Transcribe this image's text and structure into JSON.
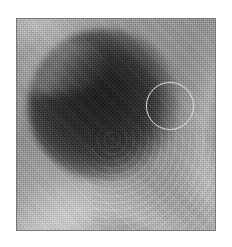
{
  "page": {
    "width": 232,
    "height": 247,
    "background_color": "#ffffff",
    "kind": "grayscale-halftone-photograph"
  },
  "plate": {
    "x": 16,
    "y": 18,
    "width": 200,
    "height": 213,
    "border_color": "#787878",
    "caption": "",
    "description": "Grayscale halftone image of a rounded cavity: a large dark central mass surrounded by lighter curved tissue walls, with a bright crescent sweeping across the lower-left and right sides."
  },
  "tones": {
    "darkest": "#262626",
    "mid": "#8e8e8e",
    "lightest": "#d6d6d6",
    "background": "#ffffff"
  },
  "regions": [
    {
      "name": "central-dark-lumen",
      "label": "",
      "center_x_pct": 44,
      "center_y_pct": 41,
      "width_pct": 76,
      "height_pct": 72,
      "tone": "#2d2d2d"
    },
    {
      "name": "upper-left-highlight-band",
      "label": "",
      "center_x_pct": 18,
      "center_y_pct": 12,
      "tone": "#c4c4c4"
    },
    {
      "name": "lower-left-bright-crescent",
      "label": "",
      "center_x_pct": 30,
      "center_y_pct": 88,
      "tone": "#cdcdcd"
    },
    {
      "name": "right-bright-wall",
      "label": "",
      "center_x_pct": 92,
      "center_y_pct": 70,
      "tone": "#c4c4c4"
    }
  ],
  "annotation": {
    "name": "circle-marker",
    "label": "",
    "shape": "circle",
    "center_x": 170,
    "center_y": 106,
    "radius": 24,
    "stroke_color": "#e2e2e2",
    "stroke_width": 1.2,
    "fill": "none"
  },
  "texture": {
    "type": "halftone-dither",
    "cell_size_px": 2
  }
}
